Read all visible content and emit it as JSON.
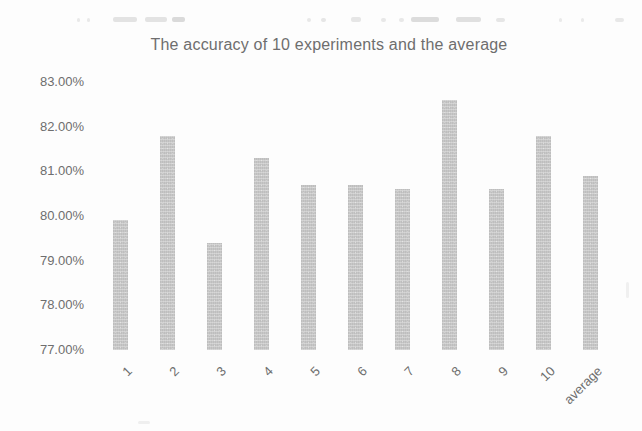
{
  "page": {
    "background": "#fdfdfd"
  },
  "chart_data": {
    "type": "bar",
    "title": "The accuracy of 10 experiments and the average",
    "categories": [
      "1",
      "2",
      "3",
      "4",
      "5",
      "6",
      "7",
      "8",
      "9",
      "10",
      "average"
    ],
    "values": [
      79.9,
      81.8,
      79.4,
      81.3,
      80.7,
      80.7,
      80.6,
      82.6,
      80.6,
      81.8,
      80.9
    ],
    "xlabel": "",
    "ylabel": "",
    "ylim": [
      77,
      83
    ],
    "ytick_step": 1,
    "ytick_labels": [
      "77.00%",
      "78.00%",
      "79.00%",
      "80.00%",
      "81.00%",
      "82.00%",
      "83.00%"
    ],
    "grid": false,
    "legend": false,
    "bar_color": "#c7c7c7",
    "text_color": "#6e6e6e"
  }
}
